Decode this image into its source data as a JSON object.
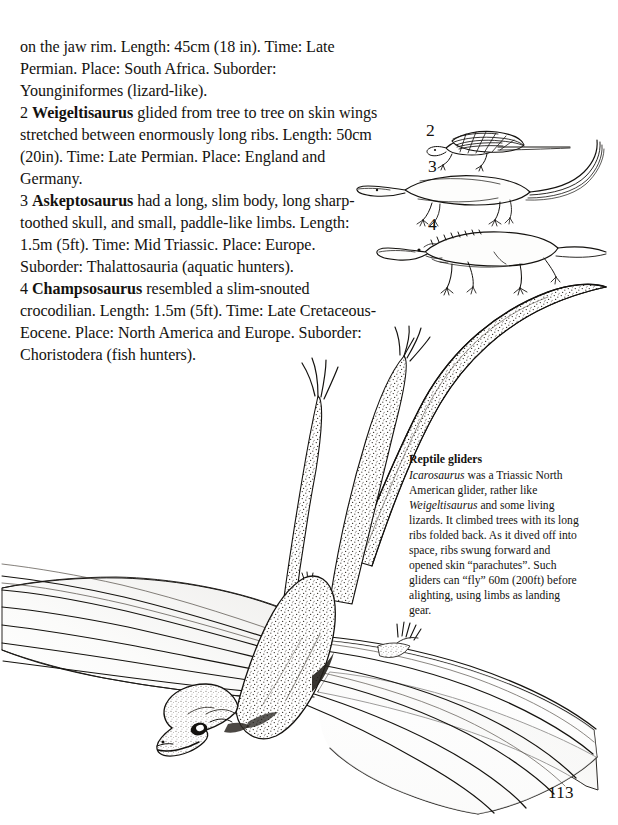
{
  "page": {
    "folio": "113",
    "background": "#ffffff",
    "ink": "#14120f"
  },
  "body_text": {
    "paragraphs": [
      "on the jaw rim. Length: 45cm (18 in). Time: Late Permian. Place: South Africa. Suborder: Younginiformes (lizard-like).",
      "2  Weigeltisaurus glided from tree to tree on skin wings stretched between enormously long ribs. Length: 50cm (20in). Time: Late Permian. Place: England and Germany.",
      "3  Askeptosaurus had a long, slim body, long sharp-toothed skull, and small, paddle-like limbs. Length: 1.5m (5ft). Time: Mid Triassic. Place: Europe. Suborder: Thalattosauria (aquatic hunters).",
      "4  Champsosaurus resembled a slim-snouted crocodilian. Length: 1.5m (5ft). Time: Late Cretaceous-Eocene. Place: North America and Europe. Suborder: Choristodera (fish hunters)."
    ],
    "entries": [
      {
        "number": "",
        "genus": "",
        "text": "on the jaw rim. Length: 45cm (18 in). Time: Late Permian. Place: South Africa. Suborder: Younginiformes (lizard-like)."
      },
      {
        "number": "2",
        "genus": "Weigeltisaurus",
        "text": "glided from tree to tree on skin wings stretched between enormously long ribs. Length: 50cm (20in). Time: Late Permian. Place: England and Germany."
      },
      {
        "number": "3",
        "genus": "Askeptosaurus",
        "text": "had a long, slim body, long sharp-toothed skull, and small, paddle-like limbs. Length: 1.5m (5ft). Time: Mid Triassic. Place: Europe. Suborder: Thalattosauria (aquatic hunters)."
      },
      {
        "number": "4",
        "genus": "Champsosaurus",
        "text": "resembled a slim-snouted crocodilian. Length: 1.5m (5ft). Time: Late Cretaceous-Eocene. Place: North America and Europe. Suborder: Choristodera (fish hunters)."
      }
    ]
  },
  "caption": {
    "heading": "Reptile gliders",
    "lead_genus": "Icarosaurus",
    "text_after_lead": " was a Triassic North American glider, rather like ",
    "second_genus": "Weigeltisaurus",
    "text_tail": " and some living lizards. It climbed trees with its long ribs folded back. As it dived off into space, ribs swung forward and opened skin “parachutes”. Such gliders can “fly” 60m (200ft) before alighting, using limbs as landing gear.",
    "full_text": "Icarosaurus was a Triassic North American glider, rather like Weigeltisaurus and some living lizards. It climbed trees with its long ribs folded back. As it dived off into space, ribs swung forward and opened skin “parachutes”. Such gliders can “fly” 60m (200ft) before alighting, using limbs as landing gear."
  },
  "figures": {
    "small": [
      {
        "label": "2",
        "subject": "Weigeltisaurus",
        "description": "small gliding reptile with ribbed skin wing, long tail, side view"
      },
      {
        "label": "3",
        "subject": "Askeptosaurus",
        "description": "long slim aquatic reptile with paddle-like limbs and very long tail"
      },
      {
        "label": "4",
        "subject": "Champsosaurus",
        "description": "slim-snouted crocodilian-like reptile with sprawling limbs"
      }
    ],
    "main": {
      "subject": "Icarosaurus",
      "description": "large line drawing of a gliding reptile seen from above-front, rib-supported skin wings spread wide, long tail curving up to the right, limbs trailing"
    }
  }
}
